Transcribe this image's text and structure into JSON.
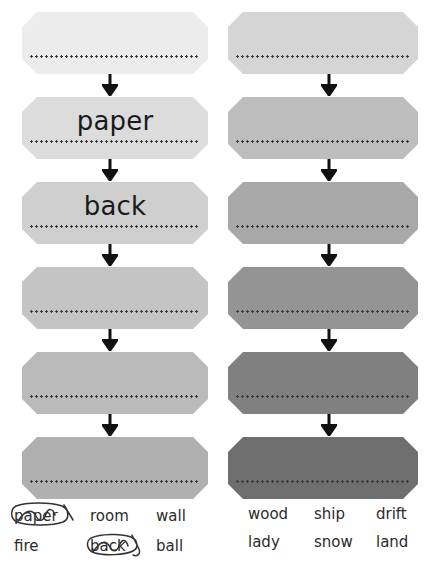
{
  "figure": {
    "type": "two-column-card-sequence",
    "columns": [
      {
        "id": "left",
        "cards": [
          {
            "index": 1,
            "label": "",
            "fill": "#ececec"
          },
          {
            "index": 2,
            "label": "paper",
            "fill": "#dcdcdc"
          },
          {
            "index": 3,
            "label": "back",
            "fill": "#cfcfcf"
          },
          {
            "index": 4,
            "label": "",
            "fill": "#c4c4c4"
          },
          {
            "index": 5,
            "label": "",
            "fill": "#bababa"
          },
          {
            "index": 6,
            "label": "",
            "fill": "#b0b0b0"
          }
        ],
        "word_rows": [
          [
            {
              "text": "paper",
              "marked": true
            },
            {
              "text": "room",
              "marked": false
            },
            {
              "text": "wall",
              "marked": false
            }
          ],
          [
            {
              "text": "fire",
              "marked": false
            },
            {
              "text": "back",
              "marked": true
            },
            {
              "text": "ball",
              "marked": false
            }
          ]
        ]
      },
      {
        "id": "right",
        "cards": [
          {
            "index": 1,
            "label": "",
            "fill": "#d5d5d5"
          },
          {
            "index": 2,
            "label": "",
            "fill": "#bdbdbd"
          },
          {
            "index": 3,
            "label": "",
            "fill": "#a8a8a8"
          },
          {
            "index": 4,
            "label": "",
            "fill": "#949494"
          },
          {
            "index": 5,
            "label": "",
            "fill": "#808080"
          },
          {
            "index": 6,
            "label": "",
            "fill": "#6e6e6e"
          }
        ],
        "word_rows": [
          [
            {
              "text": "wood",
              "marked": false
            },
            {
              "text": "ship",
              "marked": false
            },
            {
              "text": "drift",
              "marked": false
            }
          ],
          [
            {
              "text": "lady",
              "marked": false
            },
            {
              "text": "snow",
              "marked": false
            },
            {
              "text": "land",
              "marked": false
            }
          ]
        ]
      }
    ],
    "arrow_icon": "arrow-down-icon",
    "arrow_color": "#111111",
    "perforation_color": "#3a3a3a",
    "card_text_color": "#1a1a1a",
    "word_text_color": "#2b2b2b",
    "scribble_color": "#333333",
    "background": "#ffffff"
  }
}
